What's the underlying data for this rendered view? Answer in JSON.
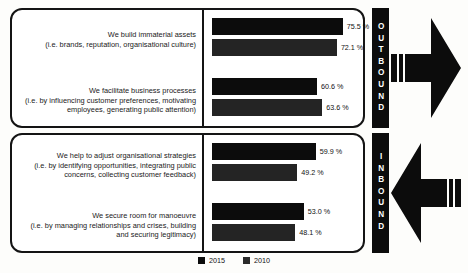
{
  "legend": {
    "entries": [
      {
        "label": "2015",
        "color": "#0c0c0c"
      },
      {
        "label": "2010",
        "color": "#2b2b2b"
      }
    ]
  },
  "sides": {
    "outbound": {
      "label": "OUTBOUND",
      "direction": "right"
    },
    "inbound": {
      "label": "INBOUND",
      "direction": "left"
    }
  },
  "panels": [
    {
      "id": "outbound",
      "rows": [
        {
          "lead": "We build immaterial assets",
          "sub": "(i.e. brands, reputation, organisational culture)",
          "v2015": "75.5 %",
          "v2010": "72.1 %"
        },
        {
          "lead": "We facilitate business processes",
          "sub": "(i.e. by influencing customer preferences, motivating employees, generating public attention)",
          "v2015": "60.6 %",
          "v2010": "63.6 %"
        }
      ]
    },
    {
      "id": "inbound",
      "rows": [
        {
          "lead": "We help to adjust organisational strategies",
          "sub": "(i.e. by identifying opportunities, integrating public concerns, collecting customer feedback)",
          "v2015": "59.9 %",
          "v2010": "49.2 %"
        },
        {
          "lead": "We secure room for manoeuvre",
          "sub": "(i.e. by managing relationships and crises, building and securing legitimacy)",
          "v2015": "53.0 %",
          "v2010": "48.1 %"
        }
      ]
    }
  ],
  "chart_data": {
    "type": "bar",
    "title": "",
    "xlabel": "",
    "ylabel": "",
    "orientation": "horizontal",
    "grid": false,
    "legend_position": "bottom-center",
    "xlim": [
      0,
      100
    ],
    "unit": "%",
    "groups": [
      "OUTBOUND",
      "INBOUND"
    ],
    "categories": [
      "We build immaterial assets (i.e. brands, reputation, organisational culture)",
      "We facilitate business processes (i.e. by influencing customer preferences, motivating employees, generating public attention)",
      "We help to adjust organisational strategies (i.e. by identifying opportunities, integrating public concerns, collecting customer feedback)",
      "We secure room for manoeuvre (i.e. by managing relationships and crises, building and securing legitimacy)"
    ],
    "category_group": [
      "OUTBOUND",
      "OUTBOUND",
      "INBOUND",
      "INBOUND"
    ],
    "series": [
      {
        "name": "2015",
        "color": "#0c0c0c",
        "values": [
          75.5,
          60.6,
          59.9,
          53.0
        ]
      },
      {
        "name": "2010",
        "color": "#2b2b2b",
        "values": [
          72.1,
          63.6,
          49.2,
          48.1
        ]
      }
    ]
  }
}
